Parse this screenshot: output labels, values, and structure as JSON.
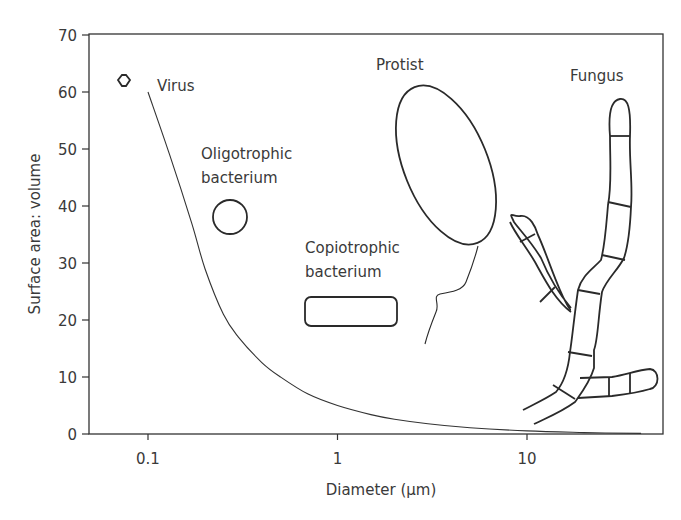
{
  "chart_data": {
    "type": "line",
    "title": "",
    "xlabel": "Diameter (μm)",
    "ylabel": "Surface area: volume",
    "xscale": "log",
    "xlim": [
      0.055,
      48
    ],
    "ylim": [
      0,
      70
    ],
    "grid": false,
    "legend": "none",
    "x_ticks": [
      {
        "value": 0.1,
        "label": "0.1"
      },
      {
        "value": 1,
        "label": "1"
      },
      {
        "value": 10,
        "label": "10"
      }
    ],
    "y_ticks": [
      {
        "value": 0,
        "label": "0"
      },
      {
        "value": 10,
        "label": "10"
      },
      {
        "value": 20,
        "label": "20"
      },
      {
        "value": 30,
        "label": "30"
      },
      {
        "value": 40,
        "label": "40"
      },
      {
        "value": 50,
        "label": "50"
      },
      {
        "value": 60,
        "label": "60"
      },
      {
        "value": 70,
        "label": "70"
      }
    ],
    "series": [
      {
        "name": "Surface area: volume curve",
        "x": [
          0.1,
          0.13,
          0.17,
          0.2,
          0.25,
          0.3,
          0.4,
          0.5,
          0.7,
          1,
          1.5,
          2,
          3,
          5,
          10,
          20,
          40
        ],
        "y": [
          60,
          49,
          37,
          29,
          21,
          17,
          12.5,
          10,
          7,
          5,
          3.4,
          2.6,
          1.8,
          1.1,
          0.55,
          0.25,
          0.1
        ]
      }
    ],
    "annotations": [
      {
        "label": "Virus",
        "shape": "hexagon",
        "x_approx": 0.075,
        "y_approx": 62
      },
      {
        "label": "Oligotrophic bacterium",
        "shape": "circle",
        "x_approx": 0.27,
        "y_approx": 38
      },
      {
        "label": "Copiotrophic bacterium",
        "shape": "rounded rectangle",
        "x_approx": 1.3,
        "y_approx": 21
      },
      {
        "label": "Protist",
        "shape": "ellipse with flagellum",
        "x_approx": 4,
        "y_approx": 47
      },
      {
        "label": "Fungus",
        "shape": "branching hyphae",
        "x_approx": 25,
        "y_approx": 30
      }
    ]
  },
  "labels": {
    "virus": "Virus",
    "oligo_line1": "Oligotrophic",
    "oligo_line2": "bacterium",
    "copio_line1": "Copiotrophic",
    "copio_line2": "bacterium",
    "protist": "Protist",
    "fungus": "Fungus"
  }
}
